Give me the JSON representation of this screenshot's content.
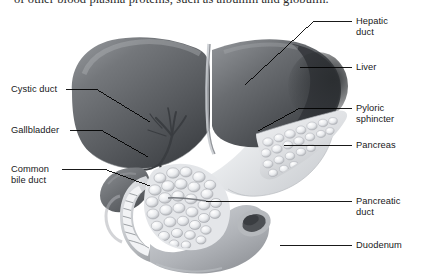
{
  "page": {
    "width": 435,
    "height": 280,
    "background": "#ffffff",
    "ink": "#18181a"
  },
  "top_text": {
    "clipped_line": "of other blood plasma proteins, such as albumin and globulin."
  },
  "figure": {
    "organs": [
      {
        "name": "liver",
        "tone": "#5e6064"
      },
      {
        "name": "gallbladder",
        "tone": "#6e7074"
      },
      {
        "name": "duodenum",
        "tone": "#b9bcc0"
      },
      {
        "name": "pancreas",
        "tone": "#d6d8db"
      },
      {
        "name": "stomach-pylorus",
        "tone": "#e6e7e9"
      }
    ]
  },
  "labels": {
    "left": [
      {
        "id": "cystic-duct",
        "text": "Cystic duct",
        "x": 11,
        "y": 84,
        "line": [
          [
            66,
            89
          ],
          [
            96,
            89
          ],
          [
            150,
            122
          ]
        ]
      },
      {
        "id": "gallbladder",
        "text": "Gallbladder",
        "x": 11,
        "y": 125,
        "line": [
          [
            70,
            130
          ],
          [
            101,
            130
          ],
          [
            148,
            157
          ]
        ]
      },
      {
        "id": "common-bile-duct",
        "text": "Common\nbile duct",
        "x": 11,
        "y": 164,
        "line": [
          [
            62,
            169
          ],
          [
            104,
            169
          ],
          [
            150,
            186
          ]
        ]
      }
    ],
    "right": [
      {
        "id": "hepatic-duct",
        "text": "Hepatic\nduct",
        "x": 356,
        "y": 16,
        "line": [
          [
            352,
            21
          ],
          [
            314,
            21
          ],
          [
            245,
            85
          ]
        ]
      },
      {
        "id": "liver",
        "text": "Liver",
        "x": 356,
        "y": 63,
        "line": [
          [
            352,
            67
          ],
          [
            300,
            67
          ]
        ]
      },
      {
        "id": "pyloric-sphincter",
        "text": "Pyloric\nsphincter",
        "x": 356,
        "y": 103,
        "line": [
          [
            352,
            108
          ],
          [
            300,
            108
          ],
          [
            258,
            131
          ]
        ]
      },
      {
        "id": "pancreas",
        "text": "Pancreas",
        "x": 356,
        "y": 140,
        "line": [
          [
            352,
            145
          ],
          [
            284,
            145
          ]
        ]
      },
      {
        "id": "pancreatic-duct",
        "text": "Pancreatic\nduct",
        "x": 356,
        "y": 196,
        "line": [
          [
            352,
            201
          ],
          [
            289,
            201
          ],
          [
            206,
            201
          ]
        ]
      },
      {
        "id": "duodenum",
        "text": "Duodenum",
        "x": 356,
        "y": 241,
        "line": [
          [
            352,
            245
          ],
          [
            280,
            245
          ]
        ]
      }
    ]
  }
}
